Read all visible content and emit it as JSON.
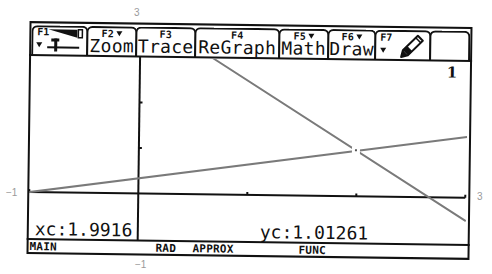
{
  "window_labels": {
    "top": "3",
    "left": "−1",
    "right": "3",
    "bottom": "−1"
  },
  "toolbar": {
    "tabs": [
      {
        "key": "F1",
        "label": "",
        "icon": "tools-icon",
        "has_menu": true
      },
      {
        "key": "F2",
        "label": "Zoom",
        "has_menu": true
      },
      {
        "key": "F3",
        "label": "Trace",
        "has_menu": false
      },
      {
        "key": "F4",
        "label": "ReGraph",
        "has_menu": false
      },
      {
        "key": "F5",
        "label": "Math",
        "has_menu": true
      },
      {
        "key": "F6",
        "label": "Draw",
        "has_menu": true
      },
      {
        "key": "F7",
        "label": "",
        "icon": "pencil-icon",
        "has_menu": true
      },
      {
        "key": "",
        "label": ""
      }
    ]
  },
  "graph": {
    "function_number": "1",
    "xc_label": "xc:1.9916",
    "yc_label": "yc:1.01261"
  },
  "status": {
    "folder": "MAIN",
    "angle_mode": "RAD",
    "exact_approx_mode": "APPROX",
    "graph_mode": "FUNC"
  },
  "chart_data": {
    "type": "line",
    "title": "",
    "xlabel": "",
    "ylabel": "",
    "xlim": [
      -1,
      3
    ],
    "ylim": [
      -1,
      3
    ],
    "xscl": 1,
    "yscl": 1,
    "grid": false,
    "legend": "none",
    "series": [
      {
        "points": [
          [
            -1,
            0
          ],
          [
            3,
            1.3333
          ]
        ]
      },
      {
        "points": [
          [
            0.6667,
            3
          ],
          [
            3,
            -0.5
          ]
        ]
      }
    ],
    "trace_cursor": {
      "x": 1.9916,
      "y": 1.01261
    }
  },
  "colors": {
    "axis": "#111111",
    "plot": "#7a7a7a",
    "outer_label": "#9a9a9a",
    "background": "#ffffff"
  }
}
